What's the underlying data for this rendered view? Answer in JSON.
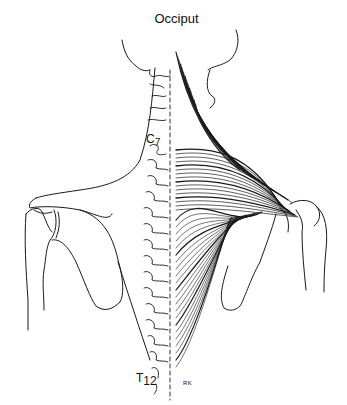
{
  "figure": {
    "labels": {
      "top": "Occiput",
      "c7_letter": "C",
      "c7_num": "7",
      "t12_letter": "T",
      "t12_num": "12",
      "signature": "RK"
    },
    "colors": {
      "ink": "#111111",
      "background": "#ffffff"
    }
  }
}
